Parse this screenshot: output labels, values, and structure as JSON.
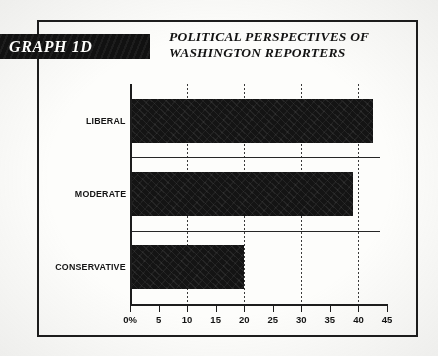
{
  "banner": {
    "label": "GRAPH 1D"
  },
  "title": {
    "line1": "POLITICAL PERSPECTIVES OF",
    "line2": "WASHINGTON REPORTERS"
  },
  "chart_data": {
    "type": "bar",
    "orientation": "horizontal",
    "title": "POLITICAL PERSPECTIVES OF WASHINGTON REPORTERS",
    "xlabel": "",
    "ylabel": "",
    "categories": [
      "LIBERAL",
      "MODERATE",
      "CONSERVATIVE"
    ],
    "values": [
      42.5,
      39,
      20
    ],
    "unit": "percent",
    "xlim": [
      0,
      45
    ],
    "xticks": [
      0,
      5,
      10,
      15,
      20,
      25,
      30,
      35,
      40,
      45
    ],
    "xtick_labels": [
      "0%",
      "5",
      "10",
      "15",
      "20",
      "25",
      "30",
      "35",
      "40",
      "45"
    ],
    "gridlines_at": [
      10,
      20,
      30,
      40
    ],
    "grid": true,
    "legend": null,
    "bar_color": "#141414",
    "frame_color": "#1d1d1d",
    "background": "#fdfdfb"
  }
}
